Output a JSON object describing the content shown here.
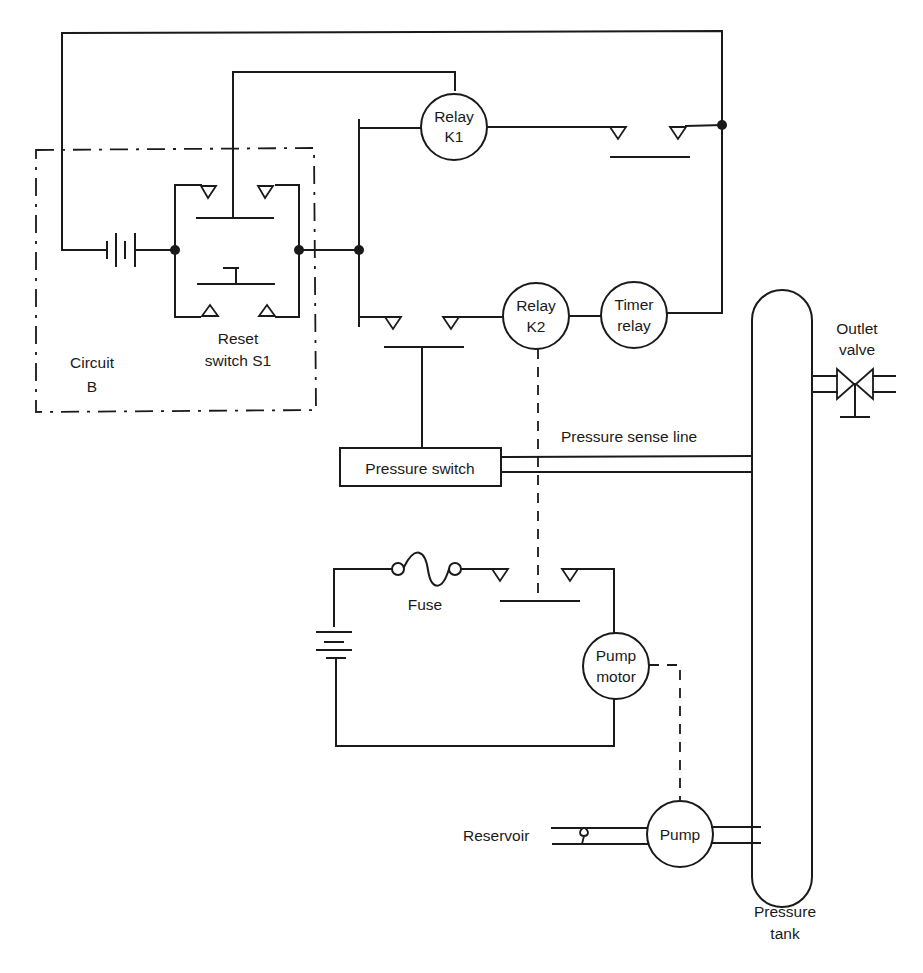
{
  "diagram": {
    "type": "circuit-schematic",
    "colors": {
      "ink": "#1a1a1a",
      "background": "#ffffff"
    },
    "labels": {
      "circuit_b": [
        "Circuit",
        "B"
      ],
      "reset_switch": [
        "Reset",
        "switch S1"
      ],
      "relay_k1": [
        "Relay",
        "K1"
      ],
      "relay_k2": [
        "Relay",
        "K2"
      ],
      "timer_relay": [
        "Timer",
        "relay"
      ],
      "outlet_valve": [
        "Outlet",
        "valve"
      ],
      "pressure_sense_line": "Pressure sense line",
      "pressure_switch": "Pressure switch",
      "fuse": "Fuse",
      "pump_motor": [
        "Pump",
        "motor"
      ],
      "reservoir": "Reservoir",
      "pump": "Pump",
      "pressure_tank": [
        "Pressure",
        "tank"
      ]
    },
    "components": [
      {
        "id": "battery-b",
        "kind": "battery"
      },
      {
        "id": "reset-switch-s1",
        "kind": "push-button-switch"
      },
      {
        "id": "relay-k1",
        "kind": "relay-coil"
      },
      {
        "id": "k1-contacts",
        "kind": "normally-open-contact"
      },
      {
        "id": "pressure-switch-contacts",
        "kind": "normally-open-contact"
      },
      {
        "id": "relay-k2",
        "kind": "relay-coil"
      },
      {
        "id": "timer-relay",
        "kind": "relay-coil"
      },
      {
        "id": "pressure-switch",
        "kind": "sensor"
      },
      {
        "id": "pressure-tank",
        "kind": "vessel"
      },
      {
        "id": "outlet-valve",
        "kind": "valve"
      },
      {
        "id": "fuse",
        "kind": "fuse"
      },
      {
        "id": "k2-contacts",
        "kind": "normally-open-contact"
      },
      {
        "id": "battery-motor",
        "kind": "battery"
      },
      {
        "id": "pump-motor",
        "kind": "motor"
      },
      {
        "id": "pump",
        "kind": "pump"
      },
      {
        "id": "check-valve",
        "kind": "check-valve"
      }
    ]
  }
}
